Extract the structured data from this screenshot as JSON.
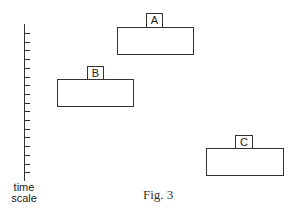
{
  "figure": {
    "caption": "Fig. 3",
    "axis": {
      "label_line1": "time",
      "label_line2": "scale",
      "tick_count": 17
    },
    "blocks": [
      {
        "label": "A",
        "rect": {
          "x": 117,
          "y": 27,
          "w": 77,
          "h": 28
        },
        "tag": {
          "x": 146,
          "y": 13,
          "w": 17,
          "h": 15
        }
      },
      {
        "label": "B",
        "rect": {
          "x": 57,
          "y": 79,
          "w": 77,
          "h": 28
        },
        "tag": {
          "x": 87,
          "y": 66,
          "w": 17,
          "h": 14
        }
      },
      {
        "label": "C",
        "rect": {
          "x": 206,
          "y": 148,
          "w": 78,
          "h": 28
        },
        "tag": {
          "x": 235,
          "y": 135,
          "w": 18,
          "h": 14
        }
      }
    ]
  }
}
